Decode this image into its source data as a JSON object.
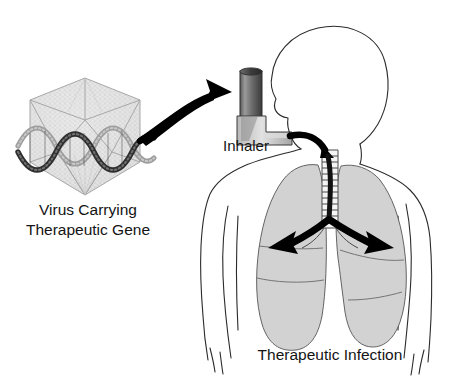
{
  "figure": {
    "title_visible": false,
    "background_color": "#ffffff",
    "caption_color": "#141414"
  },
  "labels": {
    "virus_line1": "Virus Carrying",
    "virus_line2": "Therapeutic Gene",
    "inhaler": "Inhaler",
    "caption": "Therapeutic Infection"
  },
  "icons": {
    "virus_capsid": "virus-capsid-icon",
    "dna_helix": "dna-double-helix-icon",
    "inhaler_device": "inhaler-icon",
    "human_torso": "human-torso-profile-icon",
    "lungs": "lungs-icon",
    "trachea": "trachea-icon",
    "arrow_virus_to_inhaler": "curved-arrow-icon",
    "arrow_inhaler_to_trachea": "curved-arrow-icon",
    "arrow_left_lung": "arrow-icon",
    "arrow_right_lung": "arrow-icon"
  },
  "colors": {
    "lung_fill": "#d2d2d2",
    "capsid_stroke": "#a8a8a8",
    "capsid_fill": "#e3e3e3",
    "arrow_black": "#000000",
    "body_stroke": "#2b2b2b",
    "inhaler_canister_dark": "#3c3c3c",
    "inhaler_canister_light": "#8e8e8e",
    "inhaler_mouthpiece": "#c9c9c9",
    "dna_strand_dark": "#2e2e2e",
    "dna_strand_light": "#9e9e9e"
  },
  "structure": {
    "flow": [
      "Virus Carrying Therapeutic Gene",
      "Inhaler",
      "Trachea",
      "Lungs"
    ]
  }
}
